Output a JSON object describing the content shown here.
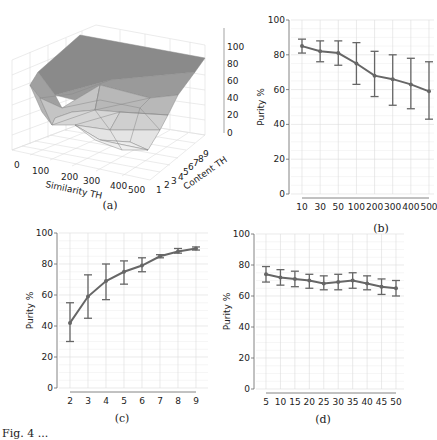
{
  "figure": {
    "caption_fragment": "Fig. 4 ..."
  },
  "chart_data": [
    {
      "panel": "(a)",
      "type": "surface3d",
      "xlabel": "Similarity TH",
      "ylabel": "Content TH",
      "zlabel": "",
      "x_ticks": [
        "0",
        "100",
        "200",
        "300",
        "400",
        "500"
      ],
      "y_ticks": [
        "1",
        "2",
        "3",
        "4",
        "5",
        "6",
        "7",
        "8",
        "9"
      ],
      "z_ticks": [
        "0",
        "20",
        "40",
        "60",
        "80",
        "100"
      ],
      "zlim": [
        0,
        100
      ],
      "description": "Purity surface: high (~85-95) at high content TH, dropping to ~40-60 at low content TH and high similarity TH"
    },
    {
      "panel": "(b)",
      "type": "line",
      "categories": [
        "10",
        "30",
        "50",
        "100",
        "200",
        "300",
        "400",
        "500"
      ],
      "values": [
        85,
        82,
        81,
        75,
        68,
        66,
        63,
        59
      ],
      "err_low": [
        81,
        76,
        74,
        63,
        56,
        51,
        49,
        43
      ],
      "err_high": [
        89,
        88,
        88,
        87,
        82,
        80,
        78,
        76
      ],
      "xlabel": "",
      "ylabel": "Purity %",
      "ylim": [
        0,
        100
      ],
      "yticks": [
        "0",
        "20",
        "40",
        "60",
        "80",
        "100"
      ],
      "grid": true
    },
    {
      "panel": "(c)",
      "type": "line",
      "categories": [
        "2",
        "3",
        "4",
        "5",
        "6",
        "7",
        "8",
        "9"
      ],
      "values": [
        42,
        59,
        69,
        75,
        79,
        85,
        88,
        90
      ],
      "err_low": [
        30,
        45,
        57,
        67,
        75,
        84,
        87,
        89
      ],
      "err_high": [
        55,
        73,
        80,
        82,
        84,
        86,
        90,
        91
      ],
      "xlabel": "",
      "ylabel": "Purity %",
      "ylim": [
        0,
        100
      ],
      "yticks": [
        "0",
        "20",
        "40",
        "60",
        "80",
        "100"
      ],
      "grid": true
    },
    {
      "panel": "(d)",
      "type": "line",
      "categories": [
        "5",
        "10",
        "15",
        "20",
        "25",
        "30",
        "35",
        "40",
        "45",
        "50"
      ],
      "values": [
        74,
        72,
        71,
        70,
        68,
        69,
        70,
        68,
        66,
        65
      ],
      "err_low": [
        69,
        67,
        66,
        65,
        64,
        64,
        65,
        64,
        61,
        60
      ],
      "err_high": [
        79,
        77,
        76,
        74,
        73,
        74,
        75,
        73,
        71,
        70
      ],
      "xlabel": "",
      "ylabel": "Purity %",
      "ylim": [
        0,
        100
      ],
      "yticks": [
        "0",
        "20",
        "40",
        "60",
        "80",
        "100"
      ],
      "grid": true
    }
  ]
}
